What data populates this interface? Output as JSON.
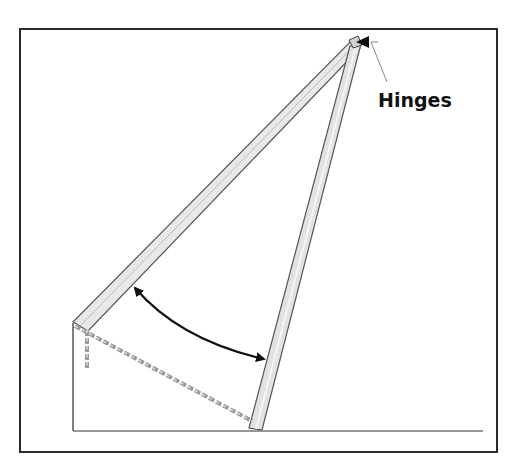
{
  "diagram": {
    "labels": {
      "hinges": "Hinges"
    },
    "colors": {
      "frame": "#2a2a2a",
      "plank_fill": "#e6e6e6",
      "plank_edge": "#555555",
      "chain": "#8a8a8a",
      "arrow": "#111111",
      "ground": "#777777"
    },
    "elements": [
      "outer-frame",
      "ground-line",
      "left-plank",
      "right-plank",
      "hinge-point",
      "chain",
      "angle-arc-arrow",
      "hinge-leader-arrow"
    ]
  }
}
